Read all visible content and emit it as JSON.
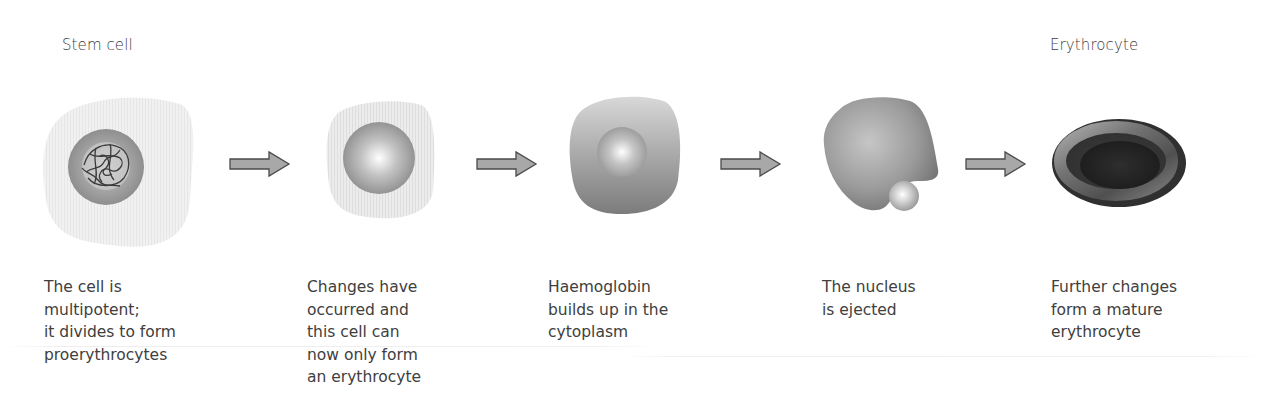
{
  "diagram": {
    "type": "process-flow",
    "title_start": "Stem cell",
    "title_end": "Erythrocyte",
    "stages": [
      {
        "id": "stem-cell",
        "icon": "stem-cell-with-chromatin",
        "caption_lines": [
          "The cell is",
          "multipotent;",
          "it divides to form",
          "proerythrocytes"
        ]
      },
      {
        "id": "proerythrocyte",
        "icon": "cell-with-round-nucleus",
        "caption_lines": [
          "Changes have",
          "occurred and",
          "this cell can",
          "now only form",
          "an erythrocyte"
        ]
      },
      {
        "id": "haemoglobin-stage",
        "icon": "cell-filling-with-haemoglobin",
        "caption_lines": [
          "Haemoglobin",
          "builds up in the",
          "cytoplasm"
        ]
      },
      {
        "id": "nucleus-ejection",
        "icon": "cell-ejecting-nucleus",
        "caption_lines": [
          "The nucleus",
          "is ejected"
        ]
      },
      {
        "id": "erythrocyte",
        "icon": "mature-erythrocyte-disc",
        "caption_lines": [
          "Further changes",
          "form a mature",
          "erythrocyte"
        ]
      }
    ],
    "arrows": [
      {
        "from": "stem-cell",
        "to": "proerythrocyte",
        "icon": "right-arrow-icon"
      },
      {
        "from": "proerythrocyte",
        "to": "haemoglobin-stage",
        "icon": "right-arrow-icon"
      },
      {
        "from": "haemoglobin-stage",
        "to": "nucleus-ejection",
        "icon": "right-arrow-icon"
      },
      {
        "from": "nucleus-ejection",
        "to": "erythrocyte",
        "icon": "right-arrow-icon"
      }
    ],
    "colors": {
      "arrow_fill": "#a8a8a8",
      "arrow_stroke": "#4a4a4a",
      "text": "#404040",
      "erythrocyte_dark": "#3a3a3a"
    }
  }
}
